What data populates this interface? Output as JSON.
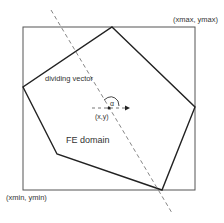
{
  "labels": {
    "top_right_corner": "(xmax, ymax)",
    "bottom_left_corner": "(xmin, ymin)",
    "dividing_vector": "dividing vector",
    "angle": "α",
    "point": "(x,y)",
    "domain": "FE domain"
  },
  "colors": {
    "stroke": "#222222",
    "bounding_box": "#444444",
    "dashed": "#666666",
    "text": "#333333"
  }
}
